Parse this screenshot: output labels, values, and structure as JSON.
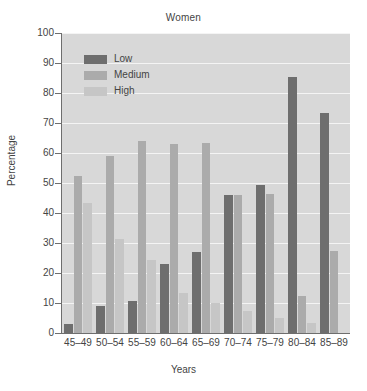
{
  "chart_data": {
    "type": "bar",
    "title": "Women",
    "xlabel": "Years",
    "ylabel": "Percentage",
    "ylim": [
      0,
      100
    ],
    "yticks": [
      0,
      10,
      20,
      30,
      40,
      50,
      60,
      70,
      80,
      90,
      100
    ],
    "grid": true,
    "legend_position": "upper-left-inside",
    "categories": [
      "45–49",
      "50–54",
      "55–59",
      "60–64",
      "65–69",
      "70–74",
      "75–79",
      "80–84",
      "85–89"
    ],
    "series": [
      {
        "name": "Low",
        "color": "#6e6e6e",
        "values": [
          3.0,
          9.0,
          10.8,
          23.0,
          27.0,
          46.0,
          49.3,
          85.5,
          73.5
        ]
      },
      {
        "name": "Medium",
        "color": "#ababab",
        "values": [
          52.5,
          59.0,
          64.0,
          63.0,
          63.2,
          46.0,
          46.2,
          12.3,
          27.5
        ]
      },
      {
        "name": "High",
        "color": "#c6c6c6",
        "values": [
          43.5,
          31.5,
          24.5,
          13.5,
          10.0,
          7.5,
          5.0,
          3.5,
          0.0
        ]
      }
    ]
  },
  "legend": {
    "items": [
      {
        "label": "Low"
      },
      {
        "label": "Medium"
      },
      {
        "label": "High"
      }
    ]
  },
  "colors": {
    "plot_background": "#d8d8d8",
    "gridline": "#f4f4f4",
    "axis": "#6e6e6e",
    "text": "#444444",
    "figure_background": "#ffffff"
  }
}
